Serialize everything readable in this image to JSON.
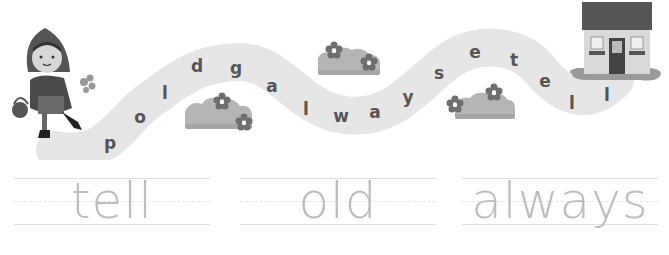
{
  "worksheet": {
    "path_letters": [
      {
        "char": "p",
        "x": 110,
        "y": 143
      },
      {
        "char": "o",
        "x": 140,
        "y": 117
      },
      {
        "char": "l",
        "x": 165,
        "y": 93
      },
      {
        "char": "d",
        "x": 197,
        "y": 66
      },
      {
        "char": "g",
        "x": 236,
        "y": 68
      },
      {
        "char": "a",
        "x": 272,
        "y": 86
      },
      {
        "char": "l",
        "x": 306,
        "y": 109
      },
      {
        "char": "w",
        "x": 341,
        "y": 116
      },
      {
        "char": "a",
        "x": 375,
        "y": 112
      },
      {
        "char": "y",
        "x": 408,
        "y": 97
      },
      {
        "char": "s",
        "x": 439,
        "y": 73
      },
      {
        "char": "e",
        "x": 475,
        "y": 52
      },
      {
        "char": "t",
        "x": 514,
        "y": 60
      },
      {
        "char": "e",
        "x": 545,
        "y": 81
      },
      {
        "char": "l",
        "x": 572,
        "y": 103
      },
      {
        "char": "l",
        "x": 607,
        "y": 95
      }
    ],
    "trace_words": [
      "tell",
      "old",
      "always"
    ],
    "colors": {
      "path": "#e6e6e6",
      "letter": "#555555",
      "trace_word": "#bdbdbd",
      "guide_line": "#e0e0e0",
      "roof": "#555555",
      "house_wall": "#d9d9d9",
      "bush": "#b5b5b5",
      "flower": "#6e6e6e"
    }
  }
}
